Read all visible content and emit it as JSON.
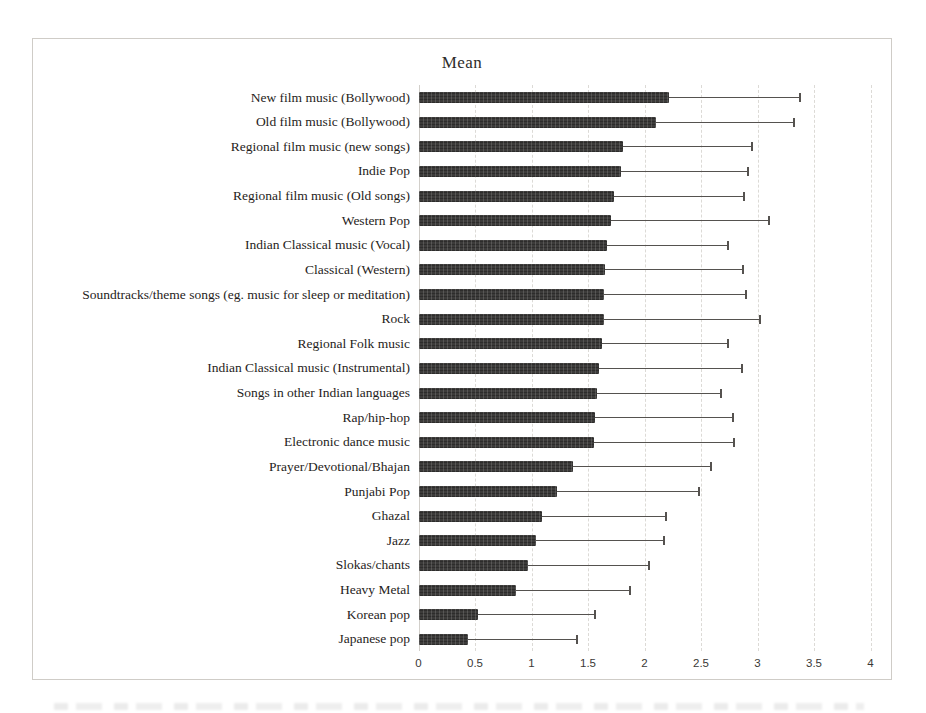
{
  "chart_data": {
    "type": "bar",
    "orientation": "horizontal",
    "title": "Mean",
    "xlabel": "",
    "ylabel": "",
    "xlim": [
      0,
      4
    ],
    "x_ticks": [
      "0",
      "0.5",
      "1",
      "1.5",
      "2",
      "2.5",
      "3",
      "3.5",
      "4"
    ],
    "grid": "vertical-dashed",
    "legend_position": "none",
    "bar_color": "#3c3b3a",
    "error_bars": "upper-only",
    "categories": [
      "New film music (Bollywood)",
      "Old film music (Bollywood)",
      "Regional film music (new songs)",
      "Indie Pop",
      "Regional film music (Old songs)",
      "Western Pop",
      "Indian Classical music (Vocal)",
      "Classical (Western)",
      "Soundtracks/theme songs (eg. music for sleep or meditation)",
      "Rock",
      "Regional Folk music",
      "Indian Classical music (Instrumental)",
      "Songs in other Indian languages",
      "Rap/hip-hop",
      "Electronic dance music",
      "Prayer/Devotional/Bhajan",
      "Punjabi Pop",
      "Ghazal",
      "Jazz",
      "Slokas/chants",
      "Heavy Metal",
      "Korean pop",
      "Japanese pop"
    ],
    "values": [
      2.22,
      2.1,
      1.81,
      1.79,
      1.73,
      1.7,
      1.67,
      1.65,
      1.64,
      1.64,
      1.62,
      1.6,
      1.58,
      1.56,
      1.55,
      1.37,
      1.23,
      1.09,
      1.04,
      0.97,
      0.86,
      0.53,
      0.44
    ],
    "error_upper": [
      3.38,
      3.32,
      2.95,
      2.92,
      2.88,
      3.1,
      2.74,
      2.87,
      2.9,
      3.02,
      2.74,
      2.86,
      2.68,
      2.78,
      2.79,
      2.59,
      2.48,
      2.19,
      2.17,
      2.04,
      1.87,
      1.56,
      1.4
    ]
  }
}
